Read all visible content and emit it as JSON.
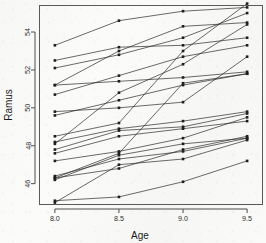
{
  "chart_data": {
    "type": "line",
    "title": "",
    "subtitle": "",
    "xlabel": "Age",
    "ylabel": "Ramus",
    "x": [
      8.0,
      8.5,
      9.0,
      9.5
    ],
    "xticklabels": [
      "8.0",
      "8.5",
      "9.0",
      "9.5"
    ],
    "yticks": [
      46,
      48,
      50,
      52,
      54
    ],
    "yticklabels": [
      "46",
      "48",
      "50",
      "52",
      "54"
    ],
    "xlim": [
      7.88,
      9.62
    ],
    "ylim": [
      44.9,
      55.4
    ],
    "grid": false,
    "legend": false,
    "legend_position": "none",
    "marker": "square",
    "annotations": [],
    "series": [
      {
        "name": "subject-1",
        "values": [
          47.8,
          48.8,
          49.0,
          49.7
        ]
      },
      {
        "name": "subject-2",
        "values": [
          46.4,
          47.3,
          47.7,
          48.4
        ]
      },
      {
        "name": "subject-3",
        "values": [
          46.3,
          46.8,
          47.8,
          48.5
        ]
      },
      {
        "name": "subject-4",
        "values": [
          45.1,
          45.3,
          46.1,
          47.2
        ]
      },
      {
        "name": "subject-5",
        "values": [
          47.6,
          48.5,
          48.9,
          49.3
        ]
      },
      {
        "name": "subject-6",
        "values": [
          52.5,
          53.2,
          53.3,
          53.7
        ]
      },
      {
        "name": "subject-7",
        "values": [
          51.2,
          53.0,
          54.3,
          54.5
        ]
      },
      {
        "name": "subject-8",
        "values": [
          49.8,
          50.0,
          50.3,
          52.7
        ]
      },
      {
        "name": "subject-9",
        "values": [
          48.1,
          50.8,
          52.3,
          54.4
        ]
      },
      {
        "name": "subject-10",
        "values": [
          45.0,
          47.0,
          47.3,
          48.3
        ]
      },
      {
        "name": "subject-11",
        "values": [
          51.2,
          51.4,
          51.6,
          51.9
        ]
      },
      {
        "name": "subject-12",
        "values": [
          48.5,
          49.2,
          53.0,
          55.5
        ]
      },
      {
        "name": "subject-13",
        "values": [
          52.1,
          52.8,
          53.7,
          55.0
        ]
      },
      {
        "name": "subject-14",
        "values": [
          48.2,
          48.9,
          49.3,
          49.8
        ]
      },
      {
        "name": "subject-15",
        "values": [
          49.6,
          50.4,
          51.2,
          51.8
        ]
      },
      {
        "name": "subject-16",
        "values": [
          50.7,
          51.7,
          52.7,
          53.3
        ]
      },
      {
        "name": "subject-17",
        "values": [
          47.2,
          47.7,
          48.4,
          49.5
        ]
      },
      {
        "name": "subject-18",
        "values": [
          53.3,
          54.6,
          55.1,
          55.3
        ]
      },
      {
        "name": "subject-19",
        "values": [
          46.2,
          47.5,
          48.1,
          48.4
        ]
      },
      {
        "name": "subject-20",
        "values": [
          46.3,
          47.6,
          51.3,
          51.8
        ]
      }
    ]
  },
  "axes": {
    "x_title": "Age",
    "y_title": "Ramus"
  }
}
